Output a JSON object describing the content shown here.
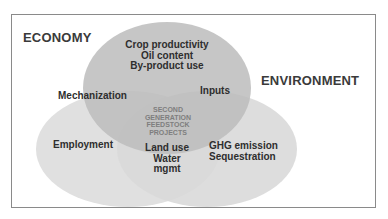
{
  "diagram": {
    "type": "venn",
    "sets": [
      {
        "name": "ECONOMY",
        "color": "#bdbdbd"
      },
      {
        "name": "ENVIRONMENT",
        "color": "#d6d6d6"
      },
      {
        "name": "SOCIAL",
        "color": "#dedede"
      }
    ],
    "titles": {
      "economy": "ECONOMY",
      "environment": "ENVIRONMENT"
    },
    "regions": {
      "top": [
        "Crop productivity",
        "Oil content",
        "By-product use"
      ],
      "top_left_overlap": "Mechanization",
      "top_right_overlap": "Inputs",
      "left": "Employment",
      "right": [
        "GHG emission",
        "Sequestration"
      ],
      "bottom_overlap": [
        "Land use",
        "Water",
        "mgmt"
      ],
      "center": [
        "SECOND",
        "GENERATION",
        "FEEDSTOCK",
        "PROJECTS"
      ]
    }
  }
}
